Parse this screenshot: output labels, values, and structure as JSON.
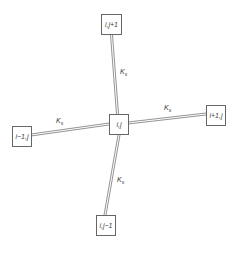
{
  "diagram": {
    "nodes": {
      "center": "i,j",
      "top": "i,j+1",
      "bottom": "i,j−1",
      "left": "i−1,j",
      "right": "i+1,j"
    },
    "edges": {
      "top": "Ks",
      "bottom": "Ks",
      "left": "Ks",
      "right": "Ks"
    }
  }
}
